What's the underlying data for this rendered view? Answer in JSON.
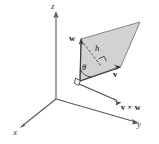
{
  "figure": {
    "caption": "",
    "background_color": "#ffffff",
    "parallelogram_fill": "#d2d2d2",
    "parallelogram_stroke": "#7b7b7b",
    "axis_color": "#58595b",
    "vector_color": "#3a3a3a"
  },
  "axes": [
    {
      "name": "x-axis",
      "label": "x"
    },
    {
      "name": "y-axis",
      "label": "y"
    },
    {
      "name": "z-axis",
      "label": "z"
    }
  ],
  "labels": {
    "x": "x",
    "y": "y",
    "z": "z",
    "w": "w",
    "v": "v",
    "h": "h",
    "theta": "θ",
    "cross": "v × w"
  },
  "annotations": {
    "height_label": "h",
    "angle_label": "θ",
    "cross_product_label": "v × w",
    "vector_v_label": "v",
    "vector_w_label": "w"
  }
}
